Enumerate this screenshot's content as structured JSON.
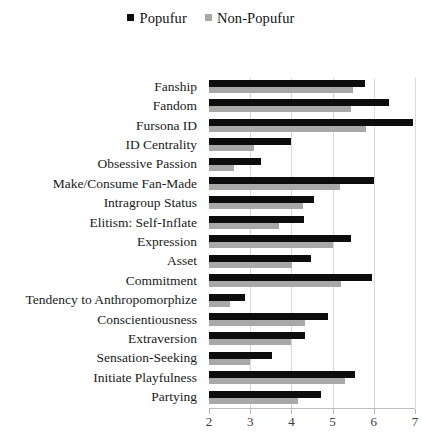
{
  "chart_data": {
    "type": "bar",
    "orientation": "horizontal",
    "title": "",
    "xlabel": "",
    "ylabel": "",
    "xlim": [
      2,
      7
    ],
    "xticks": [
      2,
      3,
      4,
      5,
      6,
      7
    ],
    "grid": true,
    "legend_position": "top-center",
    "colors": {
      "popufur": "#0d0d0d",
      "non_popufur": "#a8a8a8",
      "gridline": "#d9d9d9",
      "axis": "#bdbdbd"
    },
    "categories": [
      "Fanship",
      "Fandom",
      "Fursona ID",
      "ID Centrality",
      "Obsessive Passion",
      "Make/Consume Fan-Made",
      "Intragroup Status",
      "Elitism: Self-Inflate",
      "Expression",
      "Asset",
      "Commitment",
      "Tendency to Anthropomorphize",
      "Conscientiousness",
      "Extraversion",
      "Sensation-Seeking",
      "Initiate Playfulness",
      "Partying"
    ],
    "series": [
      {
        "name": "Popufur",
        "values": [
          5.78,
          6.36,
          6.95,
          4.0,
          3.26,
          6.0,
          4.55,
          4.3,
          5.45,
          4.48,
          5.95,
          2.88,
          4.88,
          4.33,
          3.52,
          5.55,
          4.73
        ]
      },
      {
        "name": "Non-Popufur",
        "values": [
          5.49,
          5.45,
          5.8,
          3.09,
          2.6,
          5.17,
          4.27,
          3.7,
          5.0,
          4.02,
          5.2,
          2.52,
          4.32,
          4.0,
          3.0,
          5.3,
          4.16
        ]
      }
    ]
  },
  "legend": {
    "items": [
      {
        "label": "Popufur",
        "color": "#0d0d0d"
      },
      {
        "label": "Non-Popufur",
        "color": "#a8a8a8"
      }
    ]
  }
}
